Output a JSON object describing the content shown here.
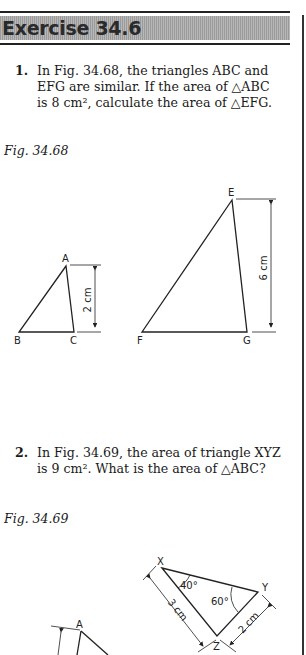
{
  "header": {
    "title": "Exercise 34.6"
  },
  "questions": [
    {
      "number": "1.",
      "lines": [
        "In Fig. 34.68, the triangles ABC and",
        "EFG are similar. If the area of △ABC",
        "is 8 cm², calculate the area of △EFG."
      ]
    },
    {
      "number": "2.",
      "lines": [
        "In Fig. 34.69, the area of triangle XYZ",
        "is 9 cm². What is the area of △ABC?"
      ]
    }
  ],
  "figures": [
    {
      "label": "Fig. 34.68",
      "triangle1": {
        "vertices": [
          "A",
          "B",
          "C"
        ],
        "dimension": "2 cm"
      },
      "triangle2": {
        "vertices": [
          "E",
          "F",
          "G"
        ],
        "dimension": "6 cm"
      }
    },
    {
      "label": "Fig. 34.69",
      "triangle1": {
        "vertices": [
          "X",
          "Y",
          "Z"
        ],
        "angles": [
          "40°",
          "60°"
        ],
        "dimensions": [
          "3 cm",
          "2 cm"
        ]
      },
      "triangle2": {
        "vertices": [
          "A"
        ]
      }
    }
  ]
}
